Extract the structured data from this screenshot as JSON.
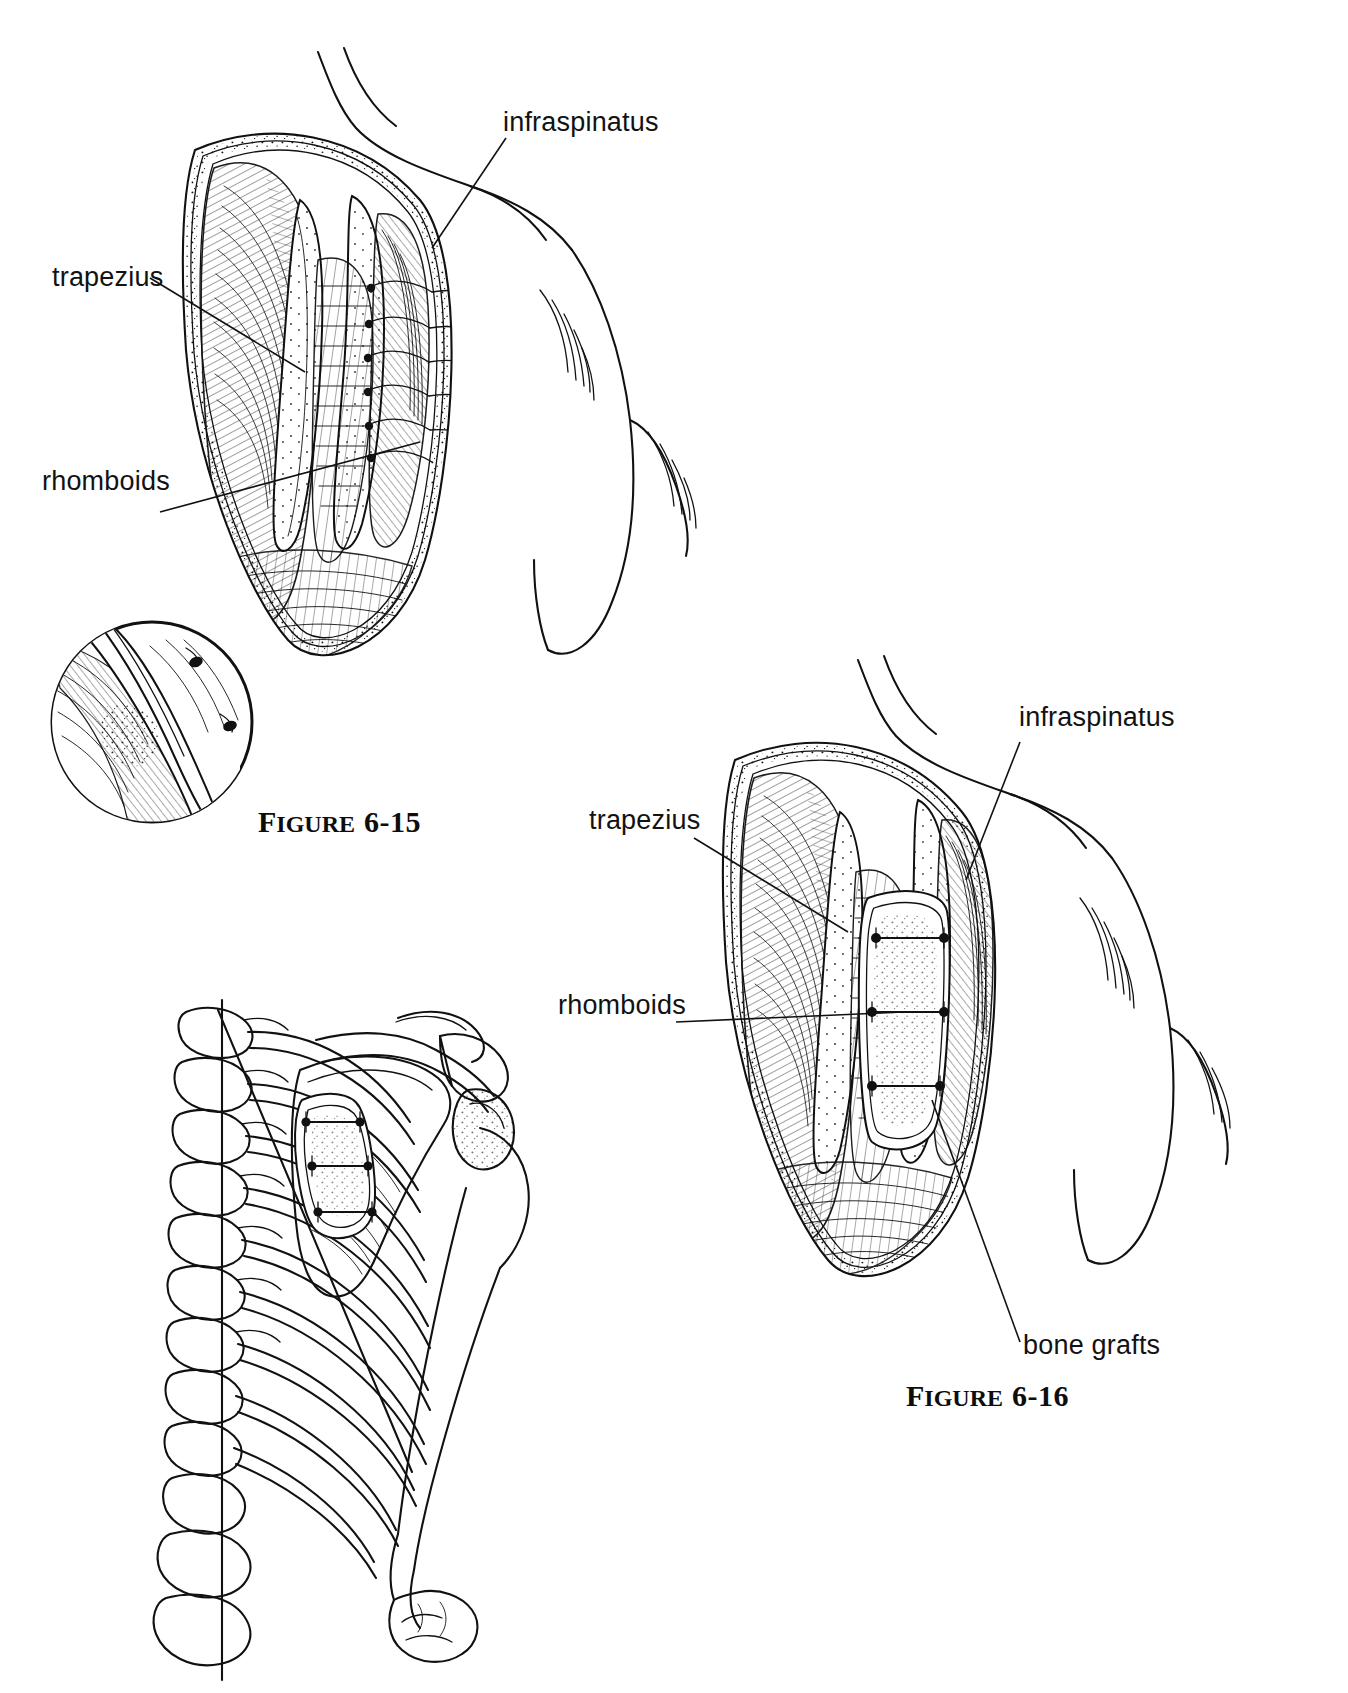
{
  "page": {
    "kind": "anatomy-illustration-plate",
    "background_color": "#ffffff",
    "ink_color": "#111111",
    "width": 1348,
    "height": 1693
  },
  "figures": [
    {
      "id": "figure-6-15",
      "caption_prefix": "F",
      "caption_word": "IGURE",
      "caption_number": "6-15",
      "caption_full": "FIGURE 6-15",
      "subject": "Posterior shoulder exposure showing trapezius, rhomboids and infraspinatus with scapular body exposed",
      "labels": [
        {
          "id": "infraspinatus",
          "text": "infraspinatus"
        },
        {
          "id": "trapezius",
          "text": "trapezius"
        },
        {
          "id": "rhomboids",
          "text": "rhomboids"
        }
      ],
      "inset": {
        "id": "detail-circle",
        "description": "circular magnified detail of suture/bone edge"
      }
    },
    {
      "id": "figure-6-16",
      "caption_prefix": "F",
      "caption_word": "IGURE",
      "caption_number": "6-16",
      "caption_full": "FIGURE 6-16",
      "subject": "Same posterior exposure after placement of bone grafts across the scapular defect",
      "labels": [
        {
          "id": "infraspinatus",
          "text": "infraspinatus"
        },
        {
          "id": "trapezius",
          "text": "trapezius"
        },
        {
          "id": "rhomboids",
          "text": "rhomboids"
        },
        {
          "id": "bone-grafts",
          "text": "bone grafts"
        }
      ]
    },
    {
      "id": "skeleton-diagram",
      "caption_full": "",
      "subject": "Posterior skeletal view of thoracic spine, ribs, scapula and humerus with bone graft strut fixed to the scapula",
      "labels": []
    }
  ]
}
